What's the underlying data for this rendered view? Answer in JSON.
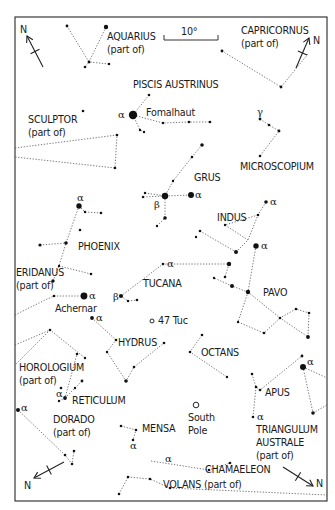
{
  "chart_data": {
    "type": "star-chart",
    "frame": {
      "x": 15,
      "y": 17,
      "w": 312,
      "h": 484
    },
    "scale_bar": {
      "label": "10°",
      "x1": 164,
      "x2": 218,
      "y": 40
    },
    "north_arrows": [
      {
        "id": "top-left",
        "x1": 43,
        "y1": 67,
        "x2": 27,
        "y2": 36,
        "label": "N",
        "lx": 20,
        "ly": 33
      },
      {
        "id": "top-right",
        "x1": 296,
        "y1": 68,
        "x2": 309,
        "y2": 38,
        "label": "N",
        "lx": 313,
        "ly": 44
      },
      {
        "id": "bottom-left",
        "x1": 64,
        "y1": 462,
        "x2": 34,
        "y2": 478,
        "label": "N",
        "lx": 24,
        "ly": 489
      },
      {
        "id": "bottom-right",
        "x1": 283,
        "y1": 467,
        "x2": 313,
        "y2": 486,
        "label": "N",
        "lx": 316,
        "ly": 487
      }
    ],
    "constellations": [
      {
        "name": "AQUARIUS",
        "sub": "(part of)",
        "lx": 107,
        "ly": 40
      },
      {
        "name": "CAPRICORNUS",
        "sub": "(part of)",
        "lx": 241,
        "ly": 34
      },
      {
        "name": "PISCIS AUSTRINUS",
        "sub": "",
        "lx": 133,
        "ly": 88
      },
      {
        "name": "SCULPTOR",
        "sub": "(part of)",
        "lx": 28,
        "ly": 123
      },
      {
        "name": "MICROSCOPIUM",
        "sub": "",
        "lx": 240,
        "ly": 170
      },
      {
        "name": "GRUS",
        "sub": "",
        "lx": 194,
        "ly": 181
      },
      {
        "name": "INDUS",
        "sub": "",
        "lx": 217,
        "ly": 221
      },
      {
        "name": "PHOENIX",
        "sub": "",
        "lx": 78,
        "ly": 250
      },
      {
        "name": "ERIDANUS",
        "sub": "(part of)",
        "lx": 16,
        "ly": 276
      },
      {
        "name": "TUCANA",
        "sub": "",
        "lx": 143,
        "ly": 287
      },
      {
        "name": "PAVO",
        "sub": "",
        "lx": 263,
        "ly": 296
      },
      {
        "name": "HYDRUS",
        "sub": "",
        "lx": 118,
        "ly": 346
      },
      {
        "name": "OCTANS",
        "sub": "",
        "lx": 201,
        "ly": 356
      },
      {
        "name": "HOROLOGIUM",
        "sub": "(part of)",
        "lx": 19,
        "ly": 371
      },
      {
        "name": "RETICULUM",
        "sub": "",
        "lx": 72,
        "ly": 404
      },
      {
        "name": "APUS",
        "sub": "",
        "lx": 265,
        "ly": 396
      },
      {
        "name": "DORADO",
        "sub": "(part of)",
        "lx": 53,
        "ly": 423
      },
      {
        "name": "MENSA",
        "sub": "",
        "lx": 142,
        "ly": 432
      },
      {
        "name": "TRIANGULUM",
        "sub": "AUSTRALE",
        "sub2": "(part of)",
        "lx": 256,
        "ly": 433
      },
      {
        "name": "CHAMAELEON",
        "sub": "",
        "lx": 205,
        "ly": 473
      },
      {
        "name": "VOLANS (part of)",
        "sub": "",
        "lx": 163,
        "ly": 488
      }
    ],
    "named_objects": [
      {
        "name": "Fomalhaut",
        "lx": 146,
        "ly": 116
      },
      {
        "name": "Achernar",
        "lx": 55,
        "ly": 312
      },
      {
        "name": "47 Tuc",
        "lx": 158,
        "ly": 324,
        "marker": "ring",
        "mx": 152,
        "my": 321
      },
      {
        "name": "South",
        "name2": "Pole",
        "lx": 188,
        "ly": 421,
        "marker": "ring",
        "mx": 196,
        "my": 405
      }
    ],
    "stars": [
      [
        67,
        26,
        1.4
      ],
      [
        106,
        27,
        2.2
      ],
      [
        89,
        62,
        1.4
      ],
      [
        85,
        67,
        1.3
      ],
      [
        109,
        64,
        1.3
      ],
      [
        222,
        51,
        1.4
      ],
      [
        281,
        87,
        1.4
      ],
      [
        83,
        111,
        1.3
      ],
      [
        149,
        95,
        1.3
      ],
      [
        133,
        115,
        4.2
      ],
      [
        163,
        123,
        1.2
      ],
      [
        189,
        122,
        1.3
      ],
      [
        210,
        122,
        1.3
      ],
      [
        140,
        130,
        1.2
      ],
      [
        144,
        132,
        1.2
      ],
      [
        260,
        119,
        1.4
      ],
      [
        269,
        125,
        1.3
      ],
      [
        279,
        131,
        1.4
      ],
      [
        260,
        156,
        1.3
      ],
      [
        117,
        135,
        1.3
      ],
      [
        115,
        168,
        1.3
      ],
      [
        202,
        145,
        1.8
      ],
      [
        192,
        157,
        1.3
      ],
      [
        173,
        181,
        1.2
      ],
      [
        145,
        193,
        1.2
      ],
      [
        143,
        197,
        1.2
      ],
      [
        165,
        196,
        3.2
      ],
      [
        191,
        195,
        3.0
      ],
      [
        165,
        218,
        1.8
      ],
      [
        157,
        226,
        1.2
      ],
      [
        79,
        206,
        2.7
      ],
      [
        85,
        212,
        1.2
      ],
      [
        101,
        213,
        1.3
      ],
      [
        80,
        230,
        1.3
      ],
      [
        40,
        245,
        1.6
      ],
      [
        66,
        243,
        1.8
      ],
      [
        59,
        266,
        1.2
      ],
      [
        91,
        274,
        1.3
      ],
      [
        266,
        202,
        1.8
      ],
      [
        258,
        215,
        1.3
      ],
      [
        225,
        225,
        1.2
      ],
      [
        200,
        231,
        1.3
      ],
      [
        196,
        237,
        1.2
      ],
      [
        236,
        252,
        2.0
      ],
      [
        256,
        246,
        2.7
      ],
      [
        163,
        264,
        1.3
      ],
      [
        229,
        264,
        2.2
      ],
      [
        225,
        277,
        1.3
      ],
      [
        53,
        281,
        1.7
      ],
      [
        84,
        296,
        3.4
      ],
      [
        54,
        296,
        1.3
      ],
      [
        121,
        296,
        2.1
      ],
      [
        128,
        301,
        1.2
      ],
      [
        137,
        300,
        1.3
      ],
      [
        214,
        278,
        1.2
      ],
      [
        232,
        286,
        2.0
      ],
      [
        248,
        292,
        2.2
      ],
      [
        238,
        322,
        1.2
      ],
      [
        264,
        333,
        1.3
      ],
      [
        280,
        318,
        1.3
      ],
      [
        296,
        309,
        1.3
      ],
      [
        309,
        313,
        1.3
      ],
      [
        308,
        337,
        1.9
      ],
      [
        92,
        318,
        1.9
      ],
      [
        116,
        340,
        1.3
      ],
      [
        107,
        352,
        1.2
      ],
      [
        164,
        343,
        1.3
      ],
      [
        126,
        381,
        1.8
      ],
      [
        134,
        367,
        1.3
      ],
      [
        50,
        330,
        1.3
      ],
      [
        85,
        358,
        1.2
      ],
      [
        77,
        354,
        1.3
      ],
      [
        202,
        335,
        1.3
      ],
      [
        190,
        352,
        1.3
      ],
      [
        227,
        377,
        1.2
      ],
      [
        61,
        388,
        1.3
      ],
      [
        82,
        381,
        1.4
      ],
      [
        75,
        388,
        1.2
      ],
      [
        65,
        398,
        1.9
      ],
      [
        59,
        401,
        1.2
      ],
      [
        252,
        374,
        1.3
      ],
      [
        256,
        387,
        1.3
      ],
      [
        260,
        390,
        1.3
      ],
      [
        302,
        356,
        1.4
      ],
      [
        303,
        367,
        3.0
      ],
      [
        313,
        413,
        1.8
      ],
      [
        253,
        417,
        1.3
      ],
      [
        18,
        410,
        2.0
      ],
      [
        65,
        455,
        1.3
      ],
      [
        74,
        451,
        1.3
      ],
      [
        72,
        464,
        1.3
      ],
      [
        121,
        426,
        1.3
      ],
      [
        136,
        430,
        1.3
      ],
      [
        133,
        440,
        1.3
      ],
      [
        209,
        470,
        1.3
      ],
      [
        230,
        463,
        1.3
      ],
      [
        170,
        488,
        1.3
      ],
      [
        128,
        477,
        1.3
      ],
      [
        150,
        479,
        1.3
      ],
      [
        119,
        494,
        1.3
      ]
    ],
    "lines": [
      [
        [
          67,
          26
        ],
        [
          89,
          62
        ],
        [
          109,
          64
        ]
      ],
      [
        [
          106,
          27
        ],
        [
          89,
          62
        ],
        [
          85,
          67
        ]
      ],
      [
        [
          222,
          51
        ],
        [
          281,
          87
        ],
        [
          308,
          54
        ]
      ],
      [
        [
          149,
          95
        ],
        [
          133,
          115
        ],
        [
          163,
          123
        ],
        [
          189,
          122
        ],
        [
          210,
          122
        ]
      ],
      [
        [
          133,
          115
        ],
        [
          140,
          130
        ],
        [
          144,
          132
        ]
      ],
      [
        [
          15,
          148
        ],
        [
          117,
          135
        ],
        [
          115,
          168
        ],
        [
          15,
          157
        ]
      ],
      [
        [
          260,
          119
        ],
        [
          269,
          125
        ],
        [
          279,
          131
        ],
        [
          260,
          156
        ]
      ],
      [
        [
          202,
          145
        ],
        [
          192,
          157
        ],
        [
          173,
          181
        ],
        [
          165,
          196
        ],
        [
          191,
          195
        ]
      ],
      [
        [
          145,
          193
        ],
        [
          165,
          196
        ],
        [
          143,
          197
        ]
      ],
      [
        [
          165,
          196
        ],
        [
          165,
          218
        ],
        [
          157,
          226
        ]
      ],
      [
        [
          79,
          206
        ],
        [
          66,
          243
        ],
        [
          59,
          266
        ],
        [
          53,
          281
        ]
      ],
      [
        [
          79,
          206
        ],
        [
          85,
          212
        ],
        [
          101,
          213
        ]
      ],
      [
        [
          40,
          245
        ],
        [
          66,
          243
        ]
      ],
      [
        [
          59,
          266
        ],
        [
          91,
          274
        ]
      ],
      [
        [
          54,
          296
        ],
        [
          84,
          296
        ]
      ],
      [
        [
          15,
          315
        ],
        [
          45,
          300
        ],
        [
          54,
          296
        ]
      ],
      [
        [
          266,
          202
        ],
        [
          258,
          215
        ],
        [
          248,
          240
        ],
        [
          236,
          252
        ]
      ],
      [
        [
          258,
          215
        ],
        [
          225,
          225
        ],
        [
          248,
          240
        ]
      ],
      [
        [
          200,
          231
        ],
        [
          236,
          252
        ]
      ],
      [
        [
          121,
          296
        ],
        [
          163,
          264
        ],
        [
          229,
          264
        ],
        [
          225,
          277
        ]
      ],
      [
        [
          121,
          296
        ],
        [
          128,
          301
        ],
        [
          137,
          300
        ]
      ],
      [
        [
          256,
          246
        ],
        [
          248,
          292
        ],
        [
          232,
          286
        ],
        [
          214,
          278
        ]
      ],
      [
        [
          248,
          292
        ],
        [
          238,
          322
        ],
        [
          264,
          333
        ],
        [
          280,
          318
        ],
        [
          296,
          309
        ],
        [
          309,
          313
        ],
        [
          308,
          337
        ]
      ],
      [
        [
          248,
          292
        ],
        [
          280,
          318
        ],
        [
          308,
          337
        ]
      ],
      [
        [
          92,
          318
        ],
        [
          116,
          340
        ],
        [
          107,
          352
        ],
        [
          126,
          381
        ],
        [
          134,
          367
        ],
        [
          164,
          343
        ]
      ],
      [
        [
          15,
          345
        ],
        [
          50,
          330
        ],
        [
          85,
          358
        ]
      ],
      [
        [
          50,
          330
        ],
        [
          15,
          365
        ]
      ],
      [
        [
          202,
          335
        ],
        [
          190,
          352
        ],
        [
          227,
          377
        ]
      ],
      [
        [
          59,
          401
        ],
        [
          65,
          398
        ],
        [
          77,
          354
        ]
      ],
      [
        [
          65,
          398
        ],
        [
          82,
          381
        ]
      ],
      [
        [
          252,
          374
        ],
        [
          256,
          387
        ],
        [
          260,
          390
        ],
        [
          302,
          356
        ]
      ],
      [
        [
          256,
          387
        ],
        [
          253,
          417
        ]
      ],
      [
        [
          303,
          367
        ],
        [
          313,
          413
        ]
      ],
      [
        [
          303,
          367
        ],
        [
          327,
          378
        ]
      ],
      [
        [
          313,
          413
        ],
        [
          327,
          405
        ]
      ],
      [
        [
          18,
          410
        ],
        [
          65,
          455
        ],
        [
          72,
          464
        ],
        [
          74,
          451
        ]
      ],
      [
        [
          121,
          426
        ],
        [
          136,
          430
        ],
        [
          133,
          440
        ]
      ],
      [
        [
          151,
          461
        ],
        [
          209,
          470
        ],
        [
          230,
          463
        ]
      ],
      [
        [
          128,
          477
        ],
        [
          150,
          479
        ],
        [
          170,
          488
        ]
      ],
      [
        [
          119,
          494
        ],
        [
          128,
          477
        ]
      ],
      [
        [
          170,
          488
        ],
        [
          327,
          495
        ]
      ]
    ],
    "greek_labels": [
      {
        "t": "α",
        "x": 118,
        "y": 118
      },
      {
        "t": "γ",
        "x": 257,
        "y": 115
      },
      {
        "t": "β",
        "x": 154,
        "y": 208
      },
      {
        "t": "α",
        "x": 195,
        "y": 198
      },
      {
        "t": "α",
        "x": 270,
        "y": 205
      },
      {
        "t": "α",
        "x": 77,
        "y": 201
      },
      {
        "t": "α",
        "x": 89,
        "y": 299
      },
      {
        "t": "α",
        "x": 261,
        "y": 249
      },
      {
        "t": "α",
        "x": 167,
        "y": 267
      },
      {
        "t": "β",
        "x": 113,
        "y": 300
      },
      {
        "t": "α",
        "x": 96,
        "y": 321
      },
      {
        "t": "α",
        "x": 56,
        "y": 397
      },
      {
        "t": "α",
        "x": 21,
        "y": 411
      },
      {
        "t": "α",
        "x": 307,
        "y": 365
      },
      {
        "t": "α",
        "x": 257,
        "y": 420
      },
      {
        "t": "α",
        "x": 130,
        "y": 449
      },
      {
        "t": "α",
        "x": 165,
        "y": 462
      }
    ]
  },
  "labels": {
    "scale": "10°",
    "north": "N"
  }
}
